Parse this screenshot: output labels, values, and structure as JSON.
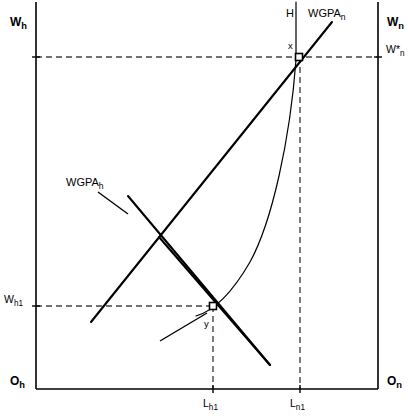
{
  "figure": {
    "type": "economics-labor-market-diagram",
    "background_color": "#ffffff",
    "ink_color": "#000000",
    "dashed_color": "#444444",
    "width": 408,
    "height": 417
  },
  "axes": {
    "left_axis_label": "W",
    "left_axis_label_sub": "h",
    "right_axis_label": "W",
    "right_axis_label_sub": "n",
    "origin_left_label": "O",
    "origin_left_sub": "h",
    "origin_right_label": "O",
    "origin_right_sub": "n"
  },
  "wage_levels": [
    {
      "name": "w-star-n",
      "label": "W*",
      "sub": "n",
      "side": "right",
      "y_px": 57
    },
    {
      "name": "w-h1",
      "label": "W",
      "sub": "h1",
      "side": "left",
      "y_px": 306
    }
  ],
  "labor_ticks": [
    {
      "name": "l-h1",
      "label": "L",
      "sub": "h1",
      "x_px": 213
    },
    {
      "name": "l-n1",
      "label": "L",
      "sub": "n1",
      "x_px": 300
    }
  ],
  "curves": [
    {
      "name": "wgpa-h",
      "label": "WGPA",
      "sub": "h",
      "description": "downward sloping home-country labour demand",
      "label_x": 66,
      "label_y": 182
    },
    {
      "name": "wgpa-n",
      "label": "WGPA",
      "sub": "n",
      "description": "upward sloping foreign-country labour demand",
      "label_x": 311,
      "label_y": 13
    },
    {
      "name": "h-curve",
      "label": "H",
      "sub": "",
      "description": "convex H schedule through points y and x",
      "label_x": 288,
      "label_y": 13
    }
  ],
  "points": [
    {
      "name": "point-x",
      "label": "x",
      "x_px": 299,
      "y_px": 57,
      "description": "equilibrium at W*n and Ln1"
    },
    {
      "name": "point-y",
      "label": "y",
      "x_px": 213,
      "y_px": 306,
      "description": "equilibrium at Wh1 and Lh1"
    }
  ]
}
